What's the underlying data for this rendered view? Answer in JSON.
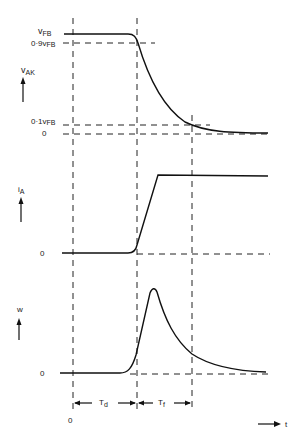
{
  "diagram": {
    "panels": [
      {
        "id": "vak",
        "axis_label": "v",
        "axis_label_sub": "AK",
        "levels": [
          {
            "label": "v",
            "sub": "FB",
            "prefix": ""
          },
          {
            "label": "v",
            "sub": "FB",
            "prefix": "0·9"
          },
          {
            "label": "v",
            "sub": "FB",
            "prefix": "0·1"
          },
          {
            "label": "0",
            "sub": "",
            "prefix": ""
          }
        ]
      },
      {
        "id": "ia",
        "axis_label": "i",
        "axis_label_sub": "A",
        "levels": [
          {
            "label": "0",
            "sub": "",
            "prefix": ""
          }
        ]
      },
      {
        "id": "w",
        "axis_label": "w",
        "axis_label_sub": "",
        "levels": [
          {
            "label": "0",
            "sub": "",
            "prefix": ""
          }
        ]
      }
    ],
    "intervals": [
      {
        "label": "T",
        "sub": "d"
      },
      {
        "label": "T",
        "sub": "f"
      }
    ],
    "time_origin_label": "0",
    "time_axis_label": "t"
  }
}
